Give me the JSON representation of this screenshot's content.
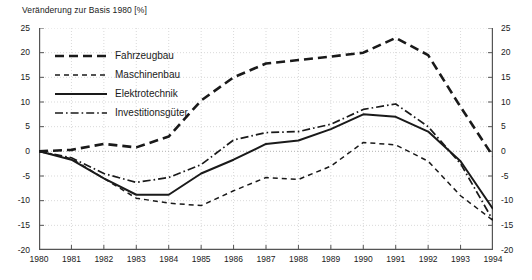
{
  "chart": {
    "axis_title": "Veränderung zur Basis 1980 [%]"
  },
  "legend": {
    "position": "inside-top-left",
    "entries": [
      {
        "label": "Fahrzeugbau",
        "style": "long-dash",
        "icon": "legend-line-long-dash-icon",
        "color": "#1a1a1a",
        "width": 2.6
      },
      {
        "label": "Maschinenbau",
        "style": "short-dash",
        "icon": "legend-line-short-dash-icon",
        "color": "#1a1a1a",
        "width": 1.4
      },
      {
        "label": "Elektrotechnik",
        "style": "solid",
        "icon": "legend-line-solid-icon",
        "color": "#1a1a1a",
        "width": 2.0
      },
      {
        "label": "Investitionsgüter",
        "style": "dash-dot",
        "icon": "legend-line-dash-dot-icon",
        "color": "#1a1a1a",
        "width": 1.6
      }
    ]
  },
  "chart_data": {
    "type": "line",
    "title": "Veränderung zur Basis 1980 [%]",
    "xlabel": "",
    "ylabel": "Veränderung zur Basis 1980 [%]",
    "x": [
      1980,
      1981,
      1982,
      1983,
      1984,
      1985,
      1986,
      1987,
      1988,
      1989,
      1990,
      1991,
      1992,
      1993,
      1994
    ],
    "categories": [
      "1980",
      "1981",
      "1982",
      "1983",
      "1984",
      "1985",
      "1986",
      "1987",
      "1988",
      "1989",
      "1990",
      "1991",
      "1992",
      "1993",
      "1994"
    ],
    "xlim": [
      1980,
      1994
    ],
    "ylim": [
      -20,
      25
    ],
    "yticks": [
      25,
      20,
      15,
      10,
      5,
      0,
      -5,
      -10,
      -15,
      -20
    ],
    "ytick_labels": [
      "25",
      "20",
      "15",
      "10",
      "5",
      "0",
      "-5",
      "-10",
      "-15",
      "-20"
    ],
    "xticks": [
      1980,
      1981,
      1982,
      1983,
      1984,
      1985,
      1986,
      1987,
      1988,
      1989,
      1990,
      1991,
      1992,
      1993,
      1994
    ],
    "grid": true,
    "grid_style": "dotted",
    "dual_y_axis": true,
    "legend": "inside-top-left",
    "series": [
      {
        "name": "Fahrzeugbau",
        "style": "long-dash",
        "color": "#1a1a1a",
        "values": [
          0,
          0.3,
          1.5,
          0.8,
          3.0,
          10.3,
          15.0,
          17.8,
          18.5,
          19.2,
          20.0,
          23.0,
          19.5,
          9.0,
          -1.0
        ]
      },
      {
        "name": "Maschinenbau",
        "style": "short-dash",
        "color": "#1a1a1a",
        "values": [
          0,
          -1.5,
          -5.5,
          -9.5,
          -10.5,
          -11.0,
          -8.0,
          -5.3,
          -5.7,
          -3.0,
          1.8,
          1.3,
          -2.0,
          -9.0,
          -14.0
        ]
      },
      {
        "name": "Elektrotechnik",
        "style": "solid",
        "color": "#1a1a1a",
        "values": [
          0,
          -1.7,
          -5.5,
          -8.8,
          -8.8,
          -4.5,
          -1.7,
          1.5,
          2.2,
          4.5,
          7.5,
          7.0,
          4.0,
          -2.0,
          -11.7
        ]
      },
      {
        "name": "Investitionsgüter",
        "style": "dash-dot",
        "color": "#1a1a1a",
        "values": [
          0,
          -1.3,
          -4.5,
          -6.3,
          -5.3,
          -2.7,
          2.3,
          3.8,
          4.0,
          5.5,
          8.5,
          9.6,
          5.0,
          -2.5,
          -14.0
        ]
      }
    ]
  },
  "colors": {
    "ink": "#1a1a1a",
    "axis": "#555555",
    "grid": "#c8c8c8",
    "background": "#ffffff"
  }
}
